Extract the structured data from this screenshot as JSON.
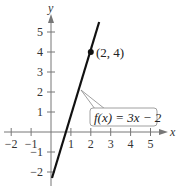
{
  "chart_data": {
    "type": "line",
    "title": "",
    "xlabel": "x",
    "ylabel": "y",
    "xlim": [
      -2,
      5
    ],
    "ylim": [
      -2,
      5
    ],
    "x_ticks": [
      -2,
      -1,
      1,
      2,
      3,
      4,
      5
    ],
    "y_ticks": [
      5,
      4,
      3,
      2,
      1,
      -1,
      -2
    ],
    "x_tick_labels": [
      "−2",
      "−1",
      "1",
      "2",
      "3",
      "4",
      "5"
    ],
    "y_tick_labels": [
      "5",
      "4",
      "3",
      "2",
      "1",
      "−1",
      "−2"
    ],
    "grid": false,
    "series": [
      {
        "name": "f(x) = 3x − 2",
        "equation": "f(x) = 3x - 2",
        "x": [
          0,
          2.5
        ],
        "y": [
          -2.3,
          5.5
        ]
      }
    ],
    "annotations": [
      {
        "type": "point",
        "x": 2,
        "y": 4,
        "label": "(2, 4)"
      },
      {
        "type": "callout",
        "label": "f(x) = 3x − 2",
        "points_to": {
          "x": 1.4,
          "y": 2.2
        }
      }
    ]
  },
  "labels": {
    "x_axis": "x",
    "y_axis": "y",
    "point": "(2, 4)",
    "function": "f(x) = 3x − 2"
  },
  "colors": {
    "axis": "#777777",
    "line": "#111111",
    "text": "#333333",
    "callout_border": "#888888"
  }
}
